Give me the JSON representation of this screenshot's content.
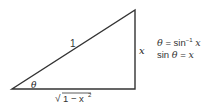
{
  "diagram": {
    "type": "right-triangle",
    "hypotenuse_label": "1",
    "opposite_label": "x",
    "adjacent_label": "√(1 − x²)",
    "adjacent_label_parts": {
      "radical": "√",
      "radicand": "1 − x",
      "exponent": "2"
    },
    "angle_label": "θ",
    "equations": [
      {
        "lhs": "θ",
        "op": "=",
        "rhs_func": "sin",
        "rhs_sup": "−1",
        "rhs_arg": "x"
      },
      {
        "lhs_func": "sin",
        "lhs_var": "θ",
        "op": "=",
        "rhs": "x"
      }
    ],
    "colors": {
      "stroke": "#333333",
      "text": "#222222",
      "background": "#ffffff"
    }
  }
}
